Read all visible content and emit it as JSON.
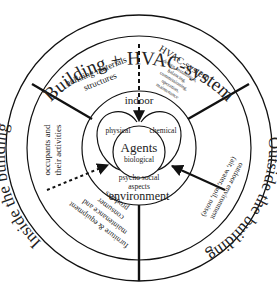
{
  "diagram": {
    "outer_ring": {
      "top_label": "Building + HVAC-system",
      "left_label": "Inside the building",
      "right_label": "Outside the building"
    },
    "middle_ring": {
      "building_materials": [
        "building materials",
        "structures"
      ],
      "hvac_title": "HVAC-system",
      "hvac_details": [
        "design, installation,",
        "balancing,",
        "commissioning,",
        "operation,",
        "maintenance"
      ],
      "occupants": [
        "occupants and",
        "their activities"
      ],
      "furniture": [
        "furniture & equipment",
        "maintenance and",
        "consumer",
        "products"
      ],
      "outdoor": [
        "outdoor environment",
        "(air, water, soil, noise)"
      ]
    },
    "center": {
      "top_label": "indoor",
      "bottom_label": "environment",
      "agents": "Agents",
      "physical": "physical",
      "chemical": "chemical",
      "biological": "biological",
      "psycho": [
        "psycho social",
        "aspects"
      ]
    },
    "colors": {
      "line": "#111111",
      "text": "#222222",
      "background": "#ffffff"
    }
  }
}
